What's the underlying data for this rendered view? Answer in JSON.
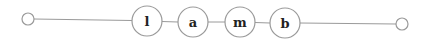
{
  "diagram": {
    "type": "linked-chain",
    "colors": {
      "stroke": "#9a9a9a",
      "fill": "#ffffff",
      "text": "#222222",
      "background": "#ffffff"
    },
    "start_terminal": {
      "cx": 28,
      "cy": 19,
      "r": 6
    },
    "end_terminal": {
      "cx": 402,
      "cy": 24,
      "r": 6
    },
    "nodes": [
      {
        "label": "l",
        "cx": 147,
        "cy": 21,
        "r": 15
      },
      {
        "label": "a",
        "cx": 193,
        "cy": 22,
        "r": 15
      },
      {
        "label": "m",
        "cx": 240,
        "cy": 22,
        "r": 15
      },
      {
        "label": "b",
        "cx": 285,
        "cy": 23,
        "r": 15
      }
    ]
  }
}
